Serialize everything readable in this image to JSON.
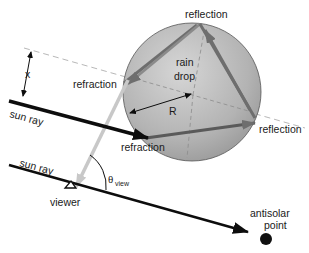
{
  "diagram": {
    "labels": {
      "reflection_top": "reflection",
      "reflection_right": "reflection",
      "refraction_left": "refraction",
      "refraction_bottom": "refraction",
      "rain_drop_line1": "rain",
      "rain_drop_line2": "drop",
      "radius": "R",
      "offset": "x",
      "sun_ray_top": "sun  ray",
      "sun_ray_bottom": "sun  ray",
      "theta": "θ",
      "theta_sub": "view",
      "viewer": "viewer",
      "antisolar_line1": "antisolar",
      "antisolar_line2": "point"
    },
    "colors": {
      "drop_fill": "#a9a9a9",
      "drop_highlight": "#d4d4d4",
      "ray_black": "#0d0d0d",
      "internal_ray": "#6e6e6e",
      "exit_ray": "#c8c8c8",
      "dashed": "#b5b5b5"
    }
  }
}
